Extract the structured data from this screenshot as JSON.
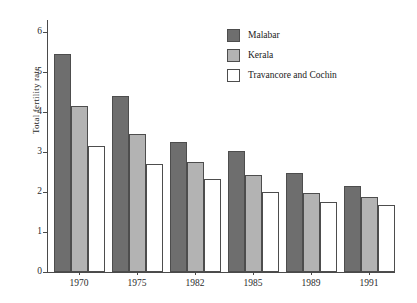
{
  "chart_data": {
    "type": "bar",
    "title": "",
    "subtitle": "",
    "xlabel": "",
    "ylabel": "Total fertility rate",
    "categories": [
      "1970",
      "1975",
      "1982",
      "1985",
      "1989",
      "1991"
    ],
    "series": [
      {
        "name": "Malabar",
        "color": "#6e6e6e",
        "values": [
          5.45,
          4.41,
          3.24,
          3.03,
          2.47,
          2.15
        ]
      },
      {
        "name": "Kerala",
        "color": "#b3b3b3",
        "values": [
          4.14,
          3.46,
          2.76,
          2.42,
          1.98,
          1.87
        ]
      },
      {
        "name": "Travancore and Cochin",
        "color": "#ffffff",
        "values": [
          3.15,
          2.7,
          2.32,
          1.99,
          1.74,
          1.67
        ]
      }
    ],
    "ylim": [
      0,
      6.2
    ],
    "y_ticks": [
      0,
      1,
      2,
      3,
      4,
      5,
      6
    ],
    "y_tick_labels": [
      "0",
      "1",
      "2",
      "3",
      "4",
      "5",
      "6"
    ],
    "grid": false,
    "legend_position": "top-right",
    "axis_color": "#4a4a4a",
    "bar_border_color": "#4d4d4d",
    "background": "#ffffff"
  }
}
